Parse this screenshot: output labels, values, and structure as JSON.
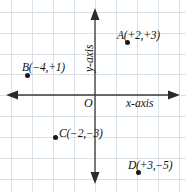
{
  "figure": {
    "background_color": "#ffffff",
    "grid_color": "#d9e2ea",
    "axis_color": "#3a3a3a",
    "point_color": "#1a1a1a",
    "origin": {
      "label": "O",
      "x_px": 95,
      "y_px": 95
    }
  },
  "axes": {
    "x_axis": {
      "label": "x-axis",
      "orientation": "horizontal",
      "arrows": "both"
    },
    "y_axis": {
      "label": "y-axis",
      "orientation": "vertical",
      "arrows": "both"
    }
  },
  "chart_data": {
    "type": "scatter",
    "title": "",
    "xlabel": "x-axis",
    "ylabel": "y-axis",
    "grid": true,
    "legend": "none",
    "xlim": [
      -5,
      5
    ],
    "ylim": [
      -6,
      5
    ],
    "points": [
      {
        "name": "A",
        "label": "A(+2,+3)",
        "x": 2,
        "y": 3,
        "dot_px": {
          "x": 127,
          "y": 42
        },
        "label_px": {
          "x": 117,
          "y": 30
        }
      },
      {
        "name": "B",
        "label": "B(−4,+1)",
        "x": -4,
        "y": 1,
        "dot_px": {
          "x": 27,
          "y": 75
        },
        "label_px": {
          "x": 22,
          "y": 62
        }
      },
      {
        "name": "C",
        "label": "C(−2,−3)",
        "x": -2,
        "y": -3,
        "dot_px": {
          "x": 55,
          "y": 137
        },
        "label_px": {
          "x": 59,
          "y": 128
        }
      },
      {
        "name": "D",
        "label": "D(+3,−5)",
        "x": 3,
        "y": -5,
        "dot_px": {
          "x": 138,
          "y": 172
        },
        "label_px": {
          "x": 128,
          "y": 160
        }
      }
    ]
  },
  "grid_geometry": {
    "vertical_lines_px": [
      11,
      32,
      53,
      74,
      95,
      116,
      137,
      158,
      179
    ],
    "horizontal_lines_px": [
      12,
      33,
      54,
      74,
      95,
      116,
      137,
      158,
      179
    ]
  }
}
